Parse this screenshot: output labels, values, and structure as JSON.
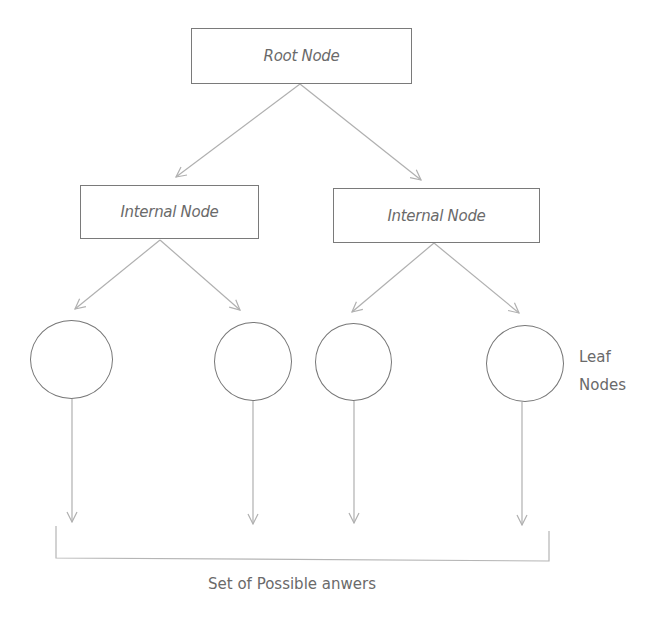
{
  "diagram": {
    "type": "decision-tree",
    "root": {
      "label": "Root Node"
    },
    "internal_nodes": [
      {
        "label": "Internal Node"
      },
      {
        "label": "Internal Node"
      }
    ],
    "leaf_nodes_label": {
      "line1": "Leaf",
      "line2": "Nodes"
    },
    "leaf_count": 4,
    "answers_label": "Set of Possible anwers",
    "colors": {
      "text": "#6a6a6a",
      "box_border": "#7a7a7a",
      "leaf_border": "#777777",
      "arrow": "#b0b0b0",
      "bracket": "#b5b5b5"
    }
  }
}
